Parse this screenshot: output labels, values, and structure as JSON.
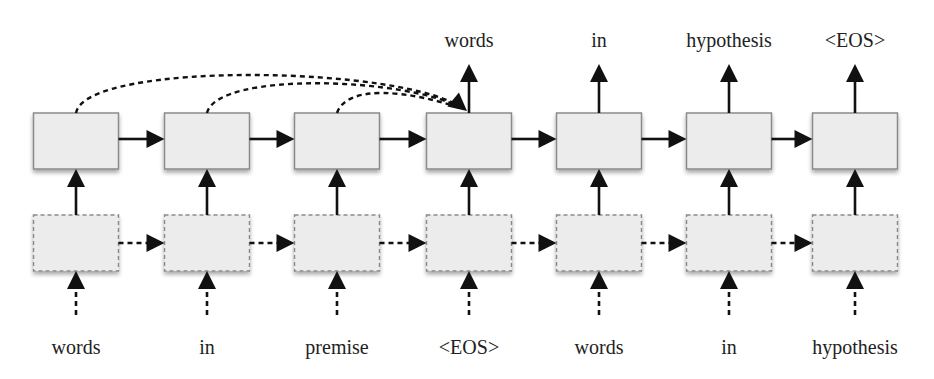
{
  "diagram": {
    "colors": {
      "box_fill": "#ececec",
      "box_border": "#8a8a8a",
      "arrow": "#111111",
      "text": "#222222",
      "background": "#ffffff"
    },
    "columns": [
      {
        "x": 76,
        "input": "words",
        "output": ""
      },
      {
        "x": 207,
        "input": "in",
        "output": ""
      },
      {
        "x": 337,
        "input": "premise",
        "output": ""
      },
      {
        "x": 469,
        "input": "<EOS>",
        "output": "words"
      },
      {
        "x": 599,
        "input": "words",
        "output": "in"
      },
      {
        "x": 729,
        "input": "in",
        "output": "hypothesis"
      },
      {
        "x": 855,
        "input": "hypothesis",
        "output": "<EOS>"
      }
    ],
    "layout": {
      "box_width": 85,
      "box_height": 56,
      "top_row_y": 113,
      "bottom_row_y": 215,
      "top_label_baseline": 46,
      "bottom_label_baseline": 353
    },
    "layers": {
      "top": {
        "name": "hidden-state-row",
        "border": "solid"
      },
      "bottom": {
        "name": "embedding-row",
        "border": "dashed"
      }
    },
    "attention_links": [
      {
        "from_column": 0,
        "to_column": 3,
        "peak_y": 70
      },
      {
        "from_column": 1,
        "to_column": 3,
        "peak_y": 81
      },
      {
        "from_column": 2,
        "to_column": 3,
        "peak_y": 94
      }
    ],
    "top_labels": [
      "",
      "",
      "",
      "words",
      "in",
      "hypothesis",
      "<EOS>"
    ],
    "bottom_labels": [
      "words",
      "in",
      "premise",
      "<EOS>",
      "words",
      "in",
      "hypothesis"
    ]
  }
}
